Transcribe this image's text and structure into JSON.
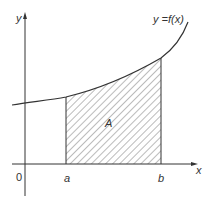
{
  "diagram": {
    "type": "definite-integral-area",
    "axes": {
      "x_label": "x",
      "y_label": "y",
      "origin_label": "0"
    },
    "curve": {
      "label": "y =f(x)"
    },
    "bounds": {
      "lower_label": "a",
      "upper_label": "b"
    },
    "region": {
      "label": "A",
      "fill": "hatched"
    },
    "colors": {
      "line": "#333333",
      "hatch": "#555555",
      "background": "#ffffff"
    }
  }
}
